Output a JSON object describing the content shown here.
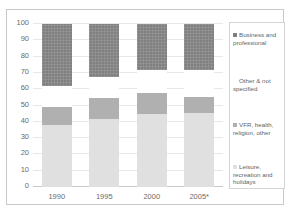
{
  "top_caption": {
    "center": "",
    "right": ""
  },
  "chart_data": {
    "type": "bar",
    "subtype": "stacked-bar-100",
    "title": "",
    "xlabel": "",
    "ylabel": "",
    "categories": [
      "1990",
      "1995",
      "2000",
      "2005*"
    ],
    "ylim": [
      0,
      100
    ],
    "yticks": [
      0,
      10,
      20,
      30,
      40,
      50,
      60,
      70,
      80,
      90,
      100
    ],
    "ytick_labels": [
      "0",
      "10",
      "20",
      "30",
      "40",
      "50",
      "60",
      "70",
      "80",
      "90",
      "100"
    ],
    "grid": true,
    "legend_position": "right",
    "stack_order_bottom_to_top": [
      "Leisure, recreation and holidays",
      "VFR, health, religion, other",
      "Other & not specified",
      "Business and professional"
    ],
    "series": [
      {
        "name": "Leisure, recreation and holidays",
        "color": "#e0e0e0",
        "values": [
          38,
          41.5,
          44.5,
          45.5
        ]
      },
      {
        "name": "VFR, health, religion, other",
        "color": "#b0b0b0",
        "values": [
          11,
          13,
          13,
          10
        ]
      },
      {
        "name": "Other & not specified",
        "color": "#ffffff",
        "values": [
          13,
          13,
          15,
          17
        ]
      },
      {
        "name": "Business and professional",
        "color": "#808080",
        "values": [
          38,
          32.5,
          27.5,
          27
        ]
      }
    ],
    "cumulative_tops": {
      "1990": {
        "leisure": 38,
        "vfr": 49,
        "other": 62,
        "business": 100
      },
      "1995": {
        "leisure": 41.5,
        "vfr": 54.5,
        "other": 67.5,
        "business": 100
      },
      "2000": {
        "leisure": 44.5,
        "vfr": 57.5,
        "other": 72,
        "business": 100
      },
      "2005*": {
        "leisure": 45.5,
        "vfr": 55.5,
        "other": 72,
        "business": 100
      }
    }
  },
  "legend": {
    "items": [
      {
        "label": "Business and professional",
        "swatch_class": "sw-business"
      },
      {
        "label": "Other & not specified",
        "swatch_class": "sw-other"
      },
      {
        "label": "VFR, health, religion, other",
        "swatch_class": "sw-vfr"
      },
      {
        "label": "Leisure, recreation and holidays",
        "swatch_class": "sw-leisure"
      }
    ]
  }
}
